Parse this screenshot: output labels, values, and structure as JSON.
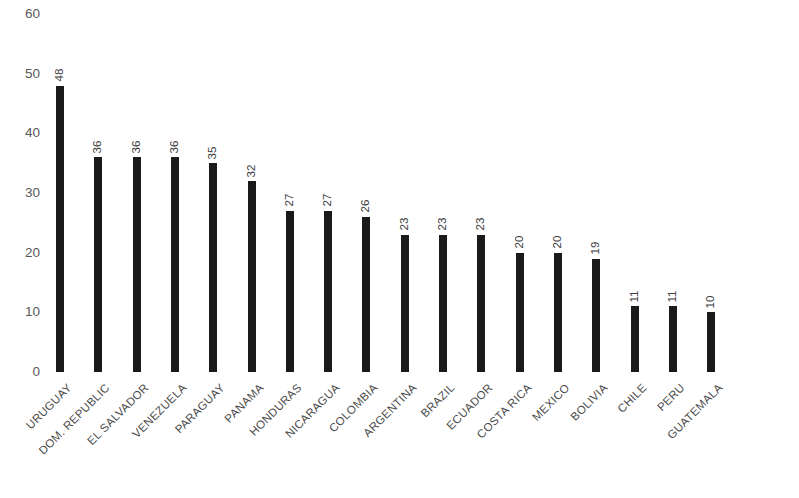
{
  "chart_data": {
    "type": "bar",
    "title": "",
    "subtitle": "",
    "xlabel": "",
    "ylabel": "",
    "ylim": [
      0,
      60
    ],
    "ytick_step": 10,
    "ytick_labels": [
      "0",
      "10",
      "20",
      "30",
      "40",
      "50",
      "60"
    ],
    "grid": false,
    "legend": false,
    "legend_position": "none",
    "bar_color": "#1a1a1a",
    "label_color": "#4a4a4a",
    "axis_label_color": "#595959",
    "value_label_rotation": -90,
    "category_label_rotation": -45,
    "categories": [
      "URUGUAY",
      "DOM. REPUBLIC",
      "EL SALVADOR",
      "VENEZUELA",
      "PARAGUAY",
      "PANAMA",
      "HONDURAS",
      "NICARAGUA",
      "COLOMBIA",
      "ARGENTINA",
      "BRAZIL",
      "ECUADOR",
      "COSTA RICA",
      "MEXICO",
      "BOLIVIA",
      "CHILE",
      "PERU",
      "GUATEMALA"
    ],
    "values": [
      48,
      36,
      36,
      36,
      35,
      32,
      27,
      27,
      26,
      23,
      23,
      23,
      20,
      20,
      19,
      11,
      11,
      10
    ],
    "value_labels": [
      "48",
      "36",
      "36",
      "36",
      "35",
      "32",
      "27",
      "27",
      "26",
      "23",
      "23",
      "23",
      "20",
      "20",
      "19",
      "11",
      "11",
      "10"
    ]
  }
}
